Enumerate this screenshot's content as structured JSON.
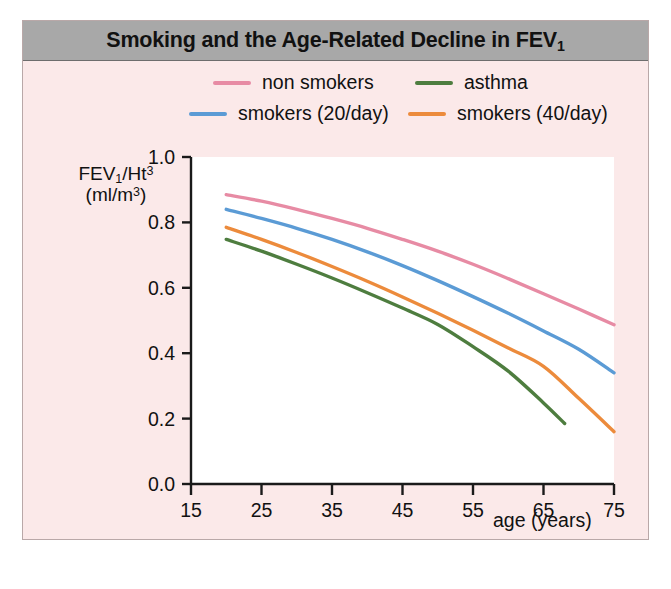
{
  "figure": {
    "title": "Smoking and the Age-Related Decline in FEV",
    "title_sub": "1",
    "background_color": "#fbe9e9",
    "title_bar_color": "#a8a8a8",
    "plot_background_color": "#ffffff"
  },
  "legend": {
    "items": [
      {
        "label": "non smokers",
        "color": "#e78ba4"
      },
      {
        "label": "smokers (20/day)",
        "color": "#5b9bd5"
      },
      {
        "label": "asthma",
        "color": "#4e7d3f"
      },
      {
        "label": "smokers (40/day)",
        "color": "#ec8b3c"
      }
    ]
  },
  "axes": {
    "ylabel_line1_main": "FEV",
    "ylabel_line1_sub": "1",
    "ylabel_line1_rest": "/Ht",
    "ylabel_line1_sup": "3",
    "ylabel_line2_main": "(ml/m",
    "ylabel_line2_sup": "3",
    "ylabel_line2_rest": ")",
    "xlabel": "age (years)",
    "yticks": [
      "1.0",
      "0.8",
      "0.6",
      "0.4",
      "0.2",
      "0.0"
    ],
    "xticks": [
      "15",
      "25",
      "35",
      "45",
      "55",
      "65",
      "75"
    ]
  },
  "chart_data": {
    "type": "line",
    "title": "Smoking and the Age-Related Decline in FEV1",
    "xlabel": "age (years)",
    "ylabel": "FEV1/Ht3 (ml/m3)",
    "xlim": [
      15,
      75
    ],
    "ylim": [
      0.0,
      1.0
    ],
    "xticks": [
      15,
      25,
      35,
      45,
      55,
      65,
      75
    ],
    "yticks": [
      0.0,
      0.2,
      0.4,
      0.6,
      0.8,
      1.0
    ],
    "grid": false,
    "legend_position": "top",
    "series": [
      {
        "name": "non smokers",
        "color": "#e78ba4",
        "x": [
          20,
          25,
          30,
          35,
          40,
          45,
          50,
          55,
          60,
          65,
          70,
          75
        ],
        "values": [
          0.885,
          0.865,
          0.84,
          0.812,
          0.782,
          0.748,
          0.712,
          0.672,
          0.628,
          0.582,
          0.535,
          0.487
        ]
      },
      {
        "name": "smokers (20/day)",
        "color": "#5b9bd5",
        "x": [
          20,
          25,
          30,
          35,
          40,
          45,
          50,
          55,
          60,
          65,
          70,
          75
        ],
        "values": [
          0.84,
          0.812,
          0.782,
          0.748,
          0.71,
          0.668,
          0.622,
          0.573,
          0.522,
          0.468,
          0.412,
          0.34
        ]
      },
      {
        "name": "smokers (40/day)",
        "color": "#ec8b3c",
        "x": [
          20,
          25,
          30,
          35,
          40,
          45,
          50,
          55,
          60,
          65,
          70,
          75
        ],
        "values": [
          0.785,
          0.748,
          0.708,
          0.665,
          0.62,
          0.572,
          0.522,
          0.47,
          0.416,
          0.36,
          0.262,
          0.16
        ]
      },
      {
        "name": "asthma",
        "color": "#4e7d3f",
        "x": [
          20,
          25,
          30,
          35,
          40,
          45,
          50,
          55,
          60,
          65,
          68
        ],
        "values": [
          0.748,
          0.712,
          0.672,
          0.63,
          0.585,
          0.538,
          0.488,
          0.42,
          0.345,
          0.248,
          0.185
        ]
      }
    ]
  }
}
